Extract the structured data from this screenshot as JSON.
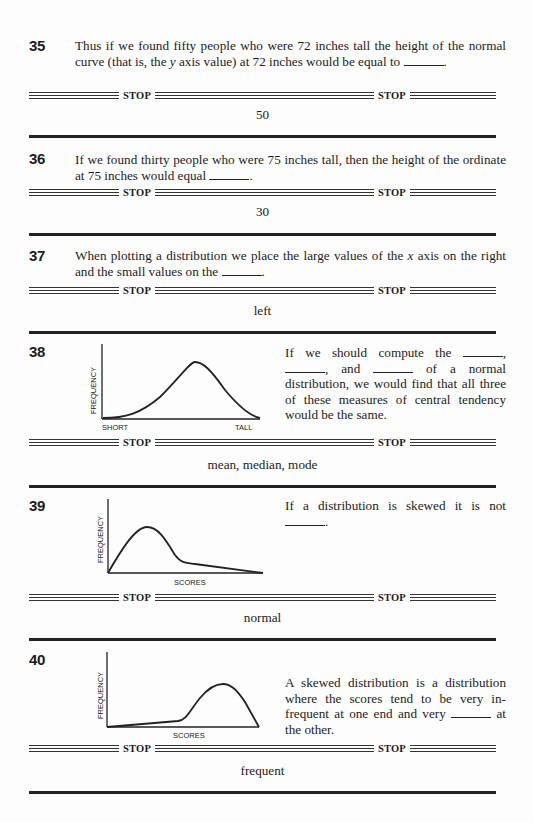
{
  "stop_label": "STOP",
  "frames": [
    {
      "number": "35",
      "text_parts": [
        "Thus if we found fifty people who were 72 inches tall the height of the normal curve (that is, the ",
        "y",
        " axis value) at 72 inches would be equal to ",
        "."
      ],
      "answer": "50"
    },
    {
      "number": "36",
      "text_parts": [
        "If we found thirty people who were 75 inches tall, then the height of the ordinate at 75 inches would equal ",
        "."
      ],
      "answer": "30"
    },
    {
      "number": "37",
      "text_parts": [
        "When plotting a distribution we place the large values of the ",
        "x",
        " axis on the right and the small values on the ",
        "."
      ],
      "answer": "left"
    },
    {
      "number": "38",
      "text_parts": [
        "If we should compute the ",
        ", ",
        ", and ",
        " of a normal distribution, we would find that all three of these measures of central tendency would be the same."
      ],
      "answer": "mean, median, mode",
      "figure": {
        "y_label": "FREQUENCY",
        "x_label_left": "SHORT",
        "x_label_right": "TALL",
        "shape": "normal"
      }
    },
    {
      "number": "39",
      "text_parts": [
        "If a distribution is skewed it is not ",
        "."
      ],
      "answer": "normal",
      "figure": {
        "y_label": "FREQUENCY",
        "x_label": "SCORES",
        "shape": "positively-skewed"
      }
    },
    {
      "number": "40",
      "text_parts": [
        "A skewed distribution is a distribution where the scores tend to be very in-frequent at one end and very ",
        " at the other."
      ],
      "answer": "frequent",
      "figure": {
        "y_label": "FREQUENCY",
        "x_label": "SCORES",
        "shape": "negatively-skewed"
      }
    }
  ]
}
